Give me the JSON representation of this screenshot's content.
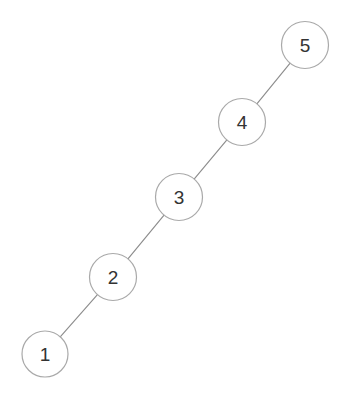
{
  "diagram": {
    "type": "node-link-graph",
    "shape": "path",
    "title": "",
    "background_color": "#ffffff",
    "canvas": {
      "width": 349,
      "height": 402
    },
    "node_style": {
      "fill": "#ffffff",
      "stroke": "#a9a9a9",
      "stroke_width": 1.2,
      "label_color": "#333333",
      "label_font_size": 19,
      "radius": 23.5
    },
    "edge_style": {
      "stroke": "#8d8d8d",
      "stroke_width": 1.15
    },
    "nodes": [
      {
        "id": "1",
        "label": "1",
        "cx": 45,
        "cy": 354,
        "r": 23.0
      },
      {
        "id": "2",
        "label": "2",
        "cx": 113,
        "cy": 277,
        "r": 23.5
      },
      {
        "id": "3",
        "label": "3",
        "cx": 179,
        "cy": 197,
        "r": 23.5
      },
      {
        "id": "4",
        "label": "4",
        "cx": 242,
        "cy": 122,
        "r": 23.5
      },
      {
        "id": "5",
        "label": "5",
        "cx": 305,
        "cy": 45,
        "r": 23.5
      }
    ],
    "edges": [
      {
        "id": "e1",
        "source": "1",
        "target": "2",
        "label": ""
      },
      {
        "id": "e2",
        "source": "2",
        "target": "3",
        "label": ""
      },
      {
        "id": "e3",
        "source": "3",
        "target": "4",
        "label": ""
      },
      {
        "id": "e4",
        "source": "4",
        "target": "5",
        "label": ""
      }
    ]
  }
}
